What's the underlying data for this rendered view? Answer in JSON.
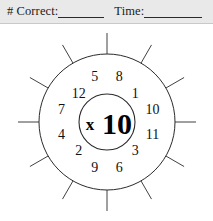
{
  "header": {
    "correct_label": "# Correct:",
    "correct_value": "",
    "time_label": "Time:",
    "time_value": ""
  },
  "wheel": {
    "operator": "x",
    "multiplier": "10",
    "center_label": "x10",
    "sector_count": 12,
    "outer_numbers": [
      "8",
      "1",
      "10",
      "11",
      "3",
      "6",
      "9",
      "2",
      "4",
      "7",
      "12",
      "5"
    ],
    "numbers_clockwise_from_top": [
      {
        "value": "8",
        "angle_deg": 15,
        "radius": 47
      },
      {
        "value": "1",
        "angle_deg": 45,
        "radius": 40
      },
      {
        "value": "10",
        "angle_deg": 75,
        "radius": 47
      },
      {
        "value": "11",
        "angle_deg": 105,
        "radius": 47
      },
      {
        "value": "3",
        "angle_deg": 135,
        "radius": 40
      },
      {
        "value": "6",
        "angle_deg": 165,
        "radius": 47
      },
      {
        "value": "9",
        "angle_deg": 195,
        "radius": 47
      },
      {
        "value": "2",
        "angle_deg": 225,
        "radius": 40
      },
      {
        "value": "4",
        "angle_deg": 255,
        "radius": 47
      },
      {
        "value": "7",
        "angle_deg": 285,
        "radius": 47
      },
      {
        "value": "12",
        "angle_deg": 315,
        "radius": 40
      },
      {
        "value": "5",
        "angle_deg": 345,
        "radius": 47
      }
    ],
    "colors": {
      "line": "#2b2b2b",
      "text": "#111111",
      "background": "#ffffff",
      "header_background": "#e9e9e9"
    }
  }
}
